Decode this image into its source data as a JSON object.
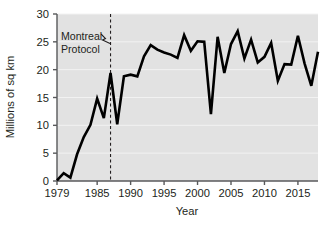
{
  "chart_data": {
    "type": "line",
    "title": "",
    "xlabel": "Year",
    "ylabel": "Millions of sq km",
    "xlim": [
      1979,
      2018
    ],
    "ylim": [
      0,
      30
    ],
    "grid": true,
    "legend": false,
    "x_ticks": [
      1979,
      1985,
      1990,
      1995,
      2000,
      2005,
      2010,
      2015
    ],
    "x_tick_labels": [
      "1979",
      "1985",
      "1990",
      "1995",
      "2000",
      "2005",
      "2010",
      "2015"
    ],
    "y_ticks": [
      0,
      5,
      10,
      15,
      20,
      25,
      30
    ],
    "y_tick_labels": [
      "0",
      "5",
      "10",
      "15",
      "20",
      "25",
      "30"
    ],
    "x": [
      1979,
      1980,
      1981,
      1982,
      1983,
      1984,
      1985,
      1986,
      1987,
      1988,
      1989,
      1990,
      1991,
      1992,
      1993,
      1994,
      1995,
      1996,
      1997,
      1998,
      1999,
      2000,
      2001,
      2002,
      2003,
      2004,
      2005,
      2006,
      2007,
      2008,
      2009,
      2010,
      2011,
      2012,
      2013,
      2014,
      2015,
      2016,
      2017,
      2018
    ],
    "values": [
      0.1,
      1.4,
      0.6,
      4.8,
      7.9,
      10.1,
      14.8,
      11.3,
      19.4,
      10.2,
      18.8,
      19.1,
      18.8,
      22.4,
      24.4,
      23.6,
      23.1,
      22.7,
      22.1,
      26.2,
      23.4,
      25.1,
      25.0,
      12.0,
      25.9,
      19.4,
      24.6,
      26.9,
      22.0,
      25.4,
      21.3,
      22.3,
      24.8,
      18.0,
      21.0,
      20.9,
      26.1,
      21.1,
      17.1,
      23.2
    ],
    "annotations": [
      {
        "label_line1": "Montreal",
        "label_line2": "Protocol",
        "x": 1987,
        "marker": "dashed-vertical-line"
      }
    ],
    "style": {
      "line_color": "#000000",
      "line_width": 2.6,
      "plot_background": "#e2e2e2",
      "gridline_color": "#f2f2f2",
      "axis_color": "#58595b",
      "annotation_line_color": "#231f20"
    }
  }
}
